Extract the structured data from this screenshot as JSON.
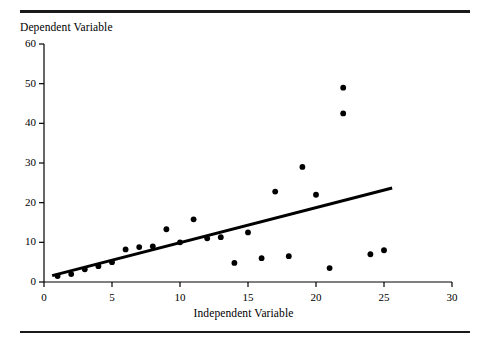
{
  "figure": {
    "name": "scatter-plot-with-regression-line",
    "background": "#ffffff",
    "ink_color": "#000000",
    "rule_color": "#1a1a1a"
  },
  "chart_data": {
    "type": "scatter",
    "title": "",
    "xlabel": "Independent Variable",
    "ylabel": "Dependent Variable",
    "xlim": [
      0,
      30
    ],
    "ylim": [
      0,
      60
    ],
    "xticks": [
      0,
      5,
      10,
      15,
      20,
      25,
      30
    ],
    "yticks": [
      0,
      10,
      20,
      30,
      40,
      50,
      60
    ],
    "xtick_labels": [
      "0",
      "5",
      "10",
      "15",
      "20",
      "25",
      "30"
    ],
    "ytick_labels": [
      "0",
      "10",
      "20",
      "30",
      "40",
      "50",
      "60"
    ],
    "grid": false,
    "legend": null,
    "marker": "filled-circle",
    "marker_size": 5,
    "points": [
      {
        "x": 1,
        "y": 1.5
      },
      {
        "x": 2,
        "y": 2.0
      },
      {
        "x": 3,
        "y": 3.2
      },
      {
        "x": 4,
        "y": 4.0
      },
      {
        "x": 5,
        "y": 5.0
      },
      {
        "x": 6,
        "y": 8.2
      },
      {
        "x": 7,
        "y": 8.8
      },
      {
        "x": 8,
        "y": 9.0
      },
      {
        "x": 9,
        "y": 13.3
      },
      {
        "x": 10,
        "y": 10.0
      },
      {
        "x": 11,
        "y": 15.8
      },
      {
        "x": 12,
        "y": 11.0
      },
      {
        "x": 13,
        "y": 11.3
      },
      {
        "x": 14,
        "y": 4.8
      },
      {
        "x": 15,
        "y": 12.5
      },
      {
        "x": 16,
        "y": 6.0
      },
      {
        "x": 17,
        "y": 22.8
      },
      {
        "x": 18,
        "y": 6.5
      },
      {
        "x": 19,
        "y": 29.0
      },
      {
        "x": 20,
        "y": 22.0
      },
      {
        "x": 21,
        "y": 3.5
      },
      {
        "x": 22,
        "y": 42.5
      },
      {
        "x": 22,
        "y": 49.0
      },
      {
        "x": 24,
        "y": 7.0
      },
      {
        "x": 25,
        "y": 8.0
      }
    ],
    "trend_line": {
      "type": "linear-fit",
      "x_start": 0.6,
      "y_start": 1.6,
      "x_end": 25.6,
      "y_end": 23.7,
      "width": 3
    }
  },
  "axis_labels": {
    "y_title": "Dependent Variable",
    "x_title": "Independent Variable"
  }
}
